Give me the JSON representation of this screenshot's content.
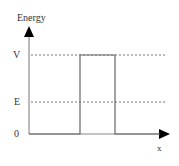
{
  "diagram": {
    "y_axis_label": "Energy",
    "x_axis_label": "x",
    "levels": [
      {
        "label": "V",
        "meaning": "barrier height"
      },
      {
        "label": "E",
        "meaning": "particle energy"
      },
      {
        "label": "0",
        "meaning": "zero potential"
      }
    ],
    "colors": {
      "axis": "#555555",
      "barrier": "#666666",
      "dashed": "#777777"
    }
  }
}
